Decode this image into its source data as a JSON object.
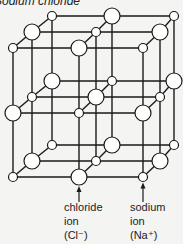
{
  "title": "Sodium chloride",
  "colors": {
    "line": "#1a1a1a",
    "ion_fill": "#ffffff",
    "background": "#f4f4f2"
  },
  "lattice": {
    "layers_y_offset": [
      0,
      65,
      129
    ],
    "base_nodes": [
      {
        "x": 52,
        "y": 16,
        "type": "Na"
      },
      {
        "x": 112,
        "y": 16,
        "type": "Cl"
      },
      {
        "x": 174,
        "y": 16,
        "type": "Na"
      },
      {
        "x": 32,
        "y": 32,
        "type": "Cl"
      },
      {
        "x": 96,
        "y": 32,
        "type": "Na"
      },
      {
        "x": 160,
        "y": 32,
        "type": "Cl"
      },
      {
        "x": 13,
        "y": 48,
        "type": "Na"
      },
      {
        "x": 79,
        "y": 48,
        "type": "Cl"
      },
      {
        "x": 143,
        "y": 48,
        "type": "Na"
      }
    ],
    "radius": {
      "Cl": 8,
      "Na": 4.5
    }
  },
  "labels": {
    "chloride": {
      "lines": [
        "chloride",
        "ion",
        "(Cl⁻)"
      ]
    },
    "sodium": {
      "lines": [
        "sodium",
        "ion",
        "(Na⁺)"
      ]
    }
  }
}
